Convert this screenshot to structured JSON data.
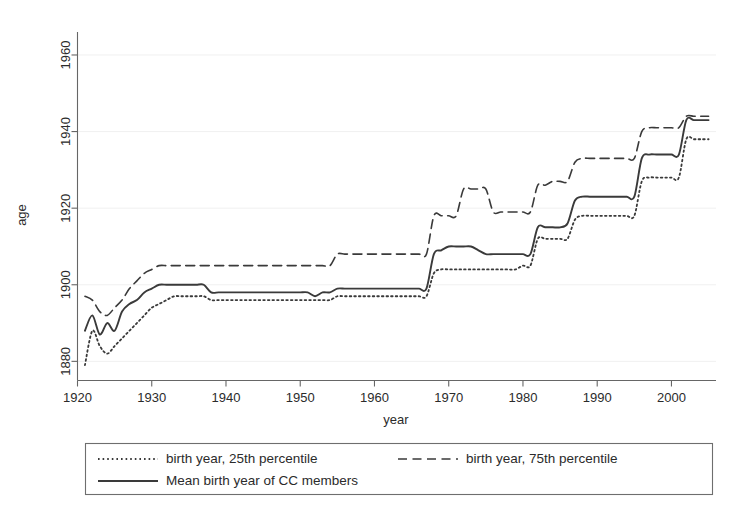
{
  "chart_data": {
    "type": "line",
    "title": "",
    "subtitle": "",
    "xlabel": "year",
    "ylabel": "age",
    "xlim": [
      1920,
      2006
    ],
    "ylim": [
      1875,
      1966
    ],
    "xticks": [
      1920,
      1930,
      1940,
      1950,
      1960,
      1970,
      1980,
      1990,
      2000
    ],
    "yticks": [
      1880,
      1900,
      1920,
      1940,
      1960
    ],
    "xtick_labels": [
      "1920",
      "1930",
      "1940",
      "1950",
      "1960",
      "1970",
      "1980",
      "1990",
      "2000"
    ],
    "ytick_labels": [
      "1880",
      "1900",
      "1920",
      "1940",
      "1960"
    ],
    "grid": "horizontal-faint",
    "legend_position": "below-plot",
    "frame": "left-and-bottom-only",
    "series": [
      {
        "name": "birth year, 25th percentile",
        "style": "dotted",
        "color": "#3a3a3a",
        "x": [
          1921,
          1922,
          1923,
          1924,
          1925,
          1926,
          1927,
          1928,
          1929,
          1930,
          1931,
          1932,
          1933,
          1934,
          1935,
          1936,
          1937,
          1938,
          1939,
          1940,
          1941,
          1942,
          1943,
          1944,
          1945,
          1946,
          1947,
          1948,
          1949,
          1950,
          1951,
          1952,
          1953,
          1954,
          1955,
          1956,
          1957,
          1958,
          1959,
          1960,
          1961,
          1962,
          1963,
          1964,
          1965,
          1966,
          1967,
          1968,
          1969,
          1970,
          1971,
          1972,
          1973,
          1974,
          1975,
          1976,
          1977,
          1978,
          1979,
          1980,
          1981,
          1982,
          1983,
          1984,
          1985,
          1986,
          1987,
          1988,
          1989,
          1990,
          1991,
          1992,
          1993,
          1994,
          1995,
          1996,
          1997,
          1998,
          1999,
          2000,
          2001,
          2002,
          2003,
          2004,
          2005
        ],
        "y": [
          1879,
          1888,
          1884,
          1882,
          1884,
          1886,
          1888,
          1890,
          1892,
          1894,
          1895,
          1896,
          1897,
          1897,
          1897,
          1897,
          1897,
          1896,
          1896,
          1896,
          1896,
          1896,
          1896,
          1896,
          1896,
          1896,
          1896,
          1896,
          1896,
          1896,
          1896,
          1896,
          1896,
          1896,
          1897,
          1897,
          1897,
          1897,
          1897,
          1897,
          1897,
          1897,
          1897,
          1897,
          1897,
          1897,
          1897,
          1903,
          1904,
          1904,
          1904,
          1904,
          1904,
          1904,
          1904,
          1904,
          1904,
          1904,
          1904,
          1905,
          1905,
          1912,
          1912,
          1912,
          1912,
          1912,
          1917,
          1918,
          1918,
          1918,
          1918,
          1918,
          1918,
          1918,
          1918,
          1927,
          1928,
          1928,
          1928,
          1928,
          1928,
          1938,
          1938,
          1938,
          1938
        ]
      },
      {
        "name": "birth year, 75th percentile",
        "style": "dashed",
        "color": "#3a3a3a",
        "x": [
          1921,
          1922,
          1923,
          1924,
          1925,
          1926,
          1927,
          1928,
          1929,
          1930,
          1931,
          1932,
          1933,
          1934,
          1935,
          1936,
          1937,
          1938,
          1939,
          1940,
          1941,
          1942,
          1943,
          1944,
          1945,
          1946,
          1947,
          1948,
          1949,
          1950,
          1951,
          1952,
          1953,
          1954,
          1955,
          1956,
          1957,
          1958,
          1959,
          1960,
          1961,
          1962,
          1963,
          1964,
          1965,
          1966,
          1967,
          1968,
          1969,
          1970,
          1971,
          1972,
          1973,
          1974,
          1975,
          1976,
          1977,
          1978,
          1979,
          1980,
          1981,
          1982,
          1983,
          1984,
          1985,
          1986,
          1987,
          1988,
          1989,
          1990,
          1991,
          1992,
          1993,
          1994,
          1995,
          1996,
          1997,
          1998,
          1999,
          2000,
          2001,
          2002,
          2003,
          2004,
          2005
        ],
        "y": [
          1897,
          1896,
          1893,
          1892,
          1894,
          1896,
          1899,
          1901,
          1903,
          1904,
          1905,
          1905,
          1905,
          1905,
          1905,
          1905,
          1905,
          1905,
          1905,
          1905,
          1905,
          1905,
          1905,
          1905,
          1905,
          1905,
          1905,
          1905,
          1905,
          1905,
          1905,
          1905,
          1905,
          1905,
          1908,
          1908,
          1908,
          1908,
          1908,
          1908,
          1908,
          1908,
          1908,
          1908,
          1908,
          1908,
          1908,
          1918,
          1918,
          1918,
          1918,
          1925,
          1925,
          1925,
          1925,
          1919,
          1919,
          1919,
          1919,
          1919,
          1919,
          1926,
          1926,
          1927,
          1927,
          1927,
          1932,
          1933,
          1933,
          1933,
          1933,
          1933,
          1933,
          1933,
          1933,
          1940,
          1941,
          1941,
          1941,
          1941,
          1941,
          1944,
          1944,
          1944,
          1944
        ]
      },
      {
        "name": "Mean birth year of CC members",
        "style": "solid",
        "color": "#3a3a3a",
        "x": [
          1921,
          1922,
          1923,
          1924,
          1925,
          1926,
          1927,
          1928,
          1929,
          1930,
          1931,
          1932,
          1933,
          1934,
          1935,
          1936,
          1937,
          1938,
          1939,
          1940,
          1941,
          1942,
          1943,
          1944,
          1945,
          1946,
          1947,
          1948,
          1949,
          1950,
          1951,
          1952,
          1953,
          1954,
          1955,
          1956,
          1957,
          1958,
          1959,
          1960,
          1961,
          1962,
          1963,
          1964,
          1965,
          1966,
          1967,
          1968,
          1969,
          1970,
          1971,
          1972,
          1973,
          1974,
          1975,
          1976,
          1977,
          1978,
          1979,
          1980,
          1981,
          1982,
          1983,
          1984,
          1985,
          1986,
          1987,
          1988,
          1989,
          1990,
          1991,
          1992,
          1993,
          1994,
          1995,
          1996,
          1997,
          1998,
          1999,
          2000,
          2001,
          2002,
          2003,
          2004,
          2005
        ],
        "y": [
          1888,
          1892,
          1887,
          1890,
          1888,
          1893,
          1895,
          1896,
          1898,
          1899,
          1900,
          1900,
          1900,
          1900,
          1900,
          1900,
          1900,
          1898,
          1898,
          1898,
          1898,
          1898,
          1898,
          1898,
          1898,
          1898,
          1898,
          1898,
          1898,
          1898,
          1898,
          1897,
          1898,
          1898,
          1899,
          1899,
          1899,
          1899,
          1899,
          1899,
          1899,
          1899,
          1899,
          1899,
          1899,
          1899,
          1899,
          1908,
          1909,
          1910,
          1910,
          1910,
          1910,
          1909,
          1908,
          1908,
          1908,
          1908,
          1908,
          1908,
          1908,
          1915,
          1915,
          1915,
          1915,
          1916,
          1922,
          1923,
          1923,
          1923,
          1923,
          1923,
          1923,
          1923,
          1923,
          1933,
          1934,
          1934,
          1934,
          1934,
          1934,
          1943,
          1943,
          1943,
          1943
        ]
      }
    ]
  },
  "axes": {
    "y_title": "age",
    "x_title": "year"
  },
  "legend": {
    "entries": [
      {
        "label": "birth year, 25th percentile",
        "style": "dotted"
      },
      {
        "label": "birth year, 75th percentile",
        "style": "dashed"
      },
      {
        "label": "Mean birth year of CC members",
        "style": "solid"
      }
    ]
  },
  "colors": {
    "line": "#3a3a3a",
    "axis": "#666666",
    "grid": "#f0f0f0",
    "background": "#ffffff",
    "text": "#2b2b2b"
  }
}
